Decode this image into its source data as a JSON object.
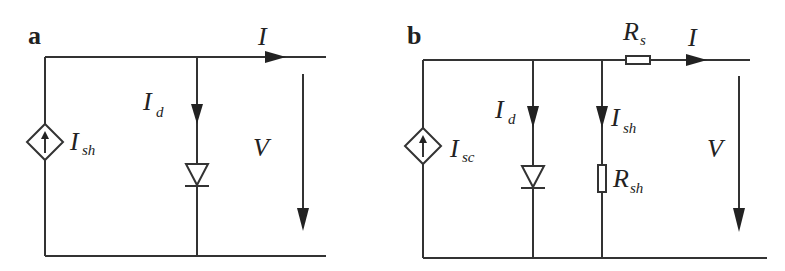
{
  "figure": {
    "panels": [
      {
        "id": "a",
        "label": "a",
        "source": {
          "type": "dependent current source",
          "main": "I",
          "sub": "sh"
        },
        "diode_current": {
          "main": "I",
          "sub": "d"
        },
        "output_current": {
          "main": "I"
        },
        "voltage": {
          "main": "V"
        }
      },
      {
        "id": "b",
        "label": "b",
        "source": {
          "type": "dependent current source",
          "main": "I",
          "sub": "sc"
        },
        "diode_current": {
          "main": "I",
          "sub": "d"
        },
        "shunt_current": {
          "main": "I",
          "sub": "sh"
        },
        "shunt_resistor": {
          "main": "R",
          "sub": "sh"
        },
        "series_resistor": {
          "main": "R",
          "sub": "s"
        },
        "output_current": {
          "main": "I"
        },
        "voltage": {
          "main": "V"
        }
      }
    ]
  }
}
